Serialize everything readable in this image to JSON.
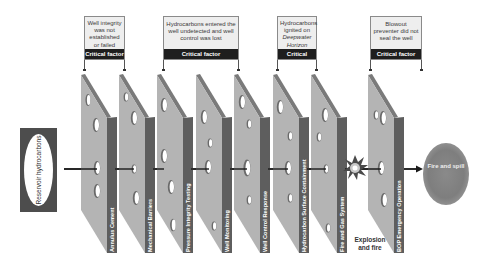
{
  "diagram": {
    "type": "swiss-cheese-model",
    "source_label": "Reservoir hydrocarbons",
    "outcome_label": "Fire and spill",
    "explosion_label": "Explosion and fire",
    "colors": {
      "slab_face": "#b4b4b4",
      "slab_side": "#5e5e5e",
      "slab_top": "#7a7a7a",
      "callout_bar": "#1e1e1e",
      "callout_bg": "#eeeeee",
      "reservoir_box": "#4d4d4d",
      "fire_cloud": "#808080"
    },
    "barriers": [
      {
        "label": "Annulus Cement"
      },
      {
        "label": "Mechanical Barriers"
      },
      {
        "label": "Pressure Integrity Testing"
      },
      {
        "label": "Well Monitoring"
      },
      {
        "label": "Well Control Response"
      },
      {
        "label": "Hydrocarbon Surface Containment"
      },
      {
        "label": "Fire and Gas System"
      },
      {
        "label": "BOP Emergency Operation"
      }
    ],
    "callouts": [
      {
        "text": "Well integrity was not established or failed",
        "tag": "Critical factor"
      },
      {
        "text": "Hydrocarbons entered the well undetected and well control was lost",
        "tag": "Critical factor"
      },
      {
        "text_pre": "Hydrocarbons ignited on",
        "text_italic": "Deepwater Horizon",
        "tag": "Critical factor"
      },
      {
        "text": "Blowout preventer did not seal the well",
        "tag": "Critical factor"
      }
    ]
  }
}
